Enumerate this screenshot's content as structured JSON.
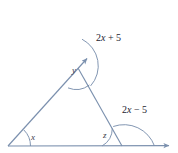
{
  "figure": {
    "type": "geometry-diagram",
    "stroke_color": "#7b90ae",
    "text_color": "#242430",
    "background": "#ffffff",
    "labels": {
      "angle_x": "x",
      "angle_y": "y",
      "angle_z": "z",
      "expr_top": "2x + 5",
      "expr_bottom": "2x − 5"
    },
    "expr_top_parts": {
      "coeff": "2",
      "var": "x",
      "op": "+",
      "const": "5"
    },
    "expr_bottom_parts": {
      "coeff": "2",
      "var": "x",
      "op": "−",
      "const": "5"
    },
    "vertices": {
      "left": "A",
      "apex": "B",
      "right": "C"
    }
  },
  "chart_data": {
    "type": "diagram",
    "title": "",
    "points": {
      "A": [
        8,
        146
      ],
      "B": [
        78,
        68
      ],
      "C": [
        122,
        146
      ],
      "ray_top_tip": [
        88,
        10
      ],
      "ray_right_tip": [
        172,
        146
      ]
    },
    "angles": [
      {
        "name": "x",
        "at": "A",
        "label": "x",
        "kind": "interior"
      },
      {
        "name": "y",
        "at": "B",
        "label": "y",
        "kind": "interior"
      },
      {
        "name": "z",
        "at": "C",
        "label": "z",
        "kind": "interior"
      },
      {
        "name": "2x+5",
        "at": "B",
        "label": "2x + 5",
        "kind": "exterior"
      },
      {
        "name": "2x-5",
        "at": "C",
        "label": "2x − 5",
        "kind": "exterior"
      }
    ]
  }
}
